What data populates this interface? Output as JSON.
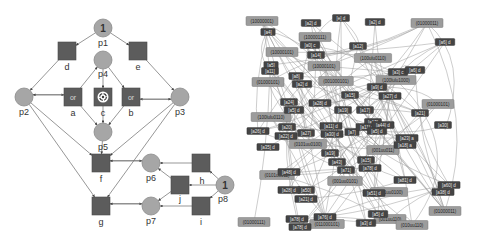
{
  "colors": {
    "place": "#a6a6a6",
    "transition": "#5c5c5c",
    "edge": "#6a6a6a",
    "state_node": "#9c9c9c",
    "action_node": "#444444",
    "background": "#ffffff"
  },
  "petri_net": {
    "places": [
      {
        "id": "p1",
        "label": "p1",
        "x": 103,
        "y": 28,
        "tokens": "1"
      },
      {
        "id": "p2",
        "label": "p2",
        "x": 24,
        "y": 97,
        "tokens": ""
      },
      {
        "id": "p3",
        "label": "p3",
        "x": 180,
        "y": 97,
        "tokens": ""
      },
      {
        "id": "p4",
        "label": "p4",
        "x": 103,
        "y": 60,
        "tokens": ""
      },
      {
        "id": "p5",
        "label": "p5",
        "x": 103,
        "y": 132,
        "tokens": ""
      },
      {
        "id": "p6",
        "label": "p6",
        "x": 151,
        "y": 163,
        "tokens": ""
      },
      {
        "id": "p7",
        "label": "p7",
        "x": 151,
        "y": 206,
        "tokens": ""
      },
      {
        "id": "p8",
        "label": "p8",
        "x": 225,
        "y": 185,
        "tokens": "1"
      }
    ],
    "transitions": [
      {
        "id": "d",
        "label": "d",
        "x": 67,
        "y": 51,
        "kind": "plain"
      },
      {
        "id": "e",
        "label": "e",
        "x": 138,
        "y": 51,
        "kind": "plain"
      },
      {
        "id": "a",
        "label": "a",
        "x": 73,
        "y": 97,
        "kind": "or",
        "glyph": "or"
      },
      {
        "id": "b",
        "label": "b",
        "x": 131,
        "y": 97,
        "kind": "or",
        "glyph": "or"
      },
      {
        "id": "c",
        "label": "c",
        "x": 103,
        "y": 97,
        "kind": "cycle"
      },
      {
        "id": "f",
        "label": "f",
        "x": 101,
        "y": 163,
        "kind": "plain"
      },
      {
        "id": "g",
        "label": "g",
        "x": 101,
        "y": 206,
        "kind": "plain"
      },
      {
        "id": "h",
        "label": "h",
        "x": 201,
        "y": 163,
        "kind": "plain"
      },
      {
        "id": "j",
        "label": "j",
        "x": 180,
        "y": 185,
        "kind": "plain"
      },
      {
        "id": "i",
        "label": "i",
        "x": 201,
        "y": 206,
        "kind": "plain"
      }
    ],
    "arcs": [
      [
        "p1",
        "d"
      ],
      [
        "p1",
        "e"
      ],
      [
        "d",
        "p2"
      ],
      [
        "e",
        "p3"
      ],
      [
        "p2",
        "a"
      ],
      [
        "a",
        "p2"
      ],
      [
        "p3",
        "b"
      ],
      [
        "b",
        "p3"
      ],
      [
        "a",
        "p4"
      ],
      [
        "p4",
        "b"
      ],
      [
        "c",
        "p5"
      ],
      [
        "a",
        "p5"
      ],
      [
        "b",
        "p5"
      ],
      [
        "p4",
        "c"
      ],
      [
        "p2",
        "f"
      ],
      [
        "p3",
        "f"
      ],
      [
        "p2",
        "g"
      ],
      [
        "p3",
        "g"
      ],
      [
        "p5",
        "f"
      ],
      [
        "f",
        "p6"
      ],
      [
        "p6",
        "f"
      ],
      [
        "g",
        "p7"
      ],
      [
        "p7",
        "g"
      ],
      [
        "h",
        "p6"
      ],
      [
        "j",
        "p6"
      ],
      [
        "j",
        "p7"
      ],
      [
        "i",
        "p7"
      ],
      [
        "p8",
        "h"
      ],
      [
        "p8",
        "j"
      ],
      [
        "p8",
        "i"
      ]
    ]
  },
  "state_graph": {
    "states": [
      {
        "label": "(10000001)",
        "x": 262,
        "y": 21
      },
      {
        "label": "(10000111)",
        "x": 315,
        "y": 37
      },
      {
        "label": "(10000101)",
        "x": 282,
        "y": 52
      },
      {
        "label": "(01000011)",
        "x": 427,
        "y": 23
      },
      {
        "label": "(100ulu0110)",
        "x": 373,
        "y": 58
      },
      {
        "label": "(10000101)",
        "x": 324,
        "y": 66
      },
      {
        "label": "(01000101)",
        "x": 268,
        "y": 82
      },
      {
        "label": "(001000101)",
        "x": 336,
        "y": 81
      },
      {
        "label": "(100lulu1000)",
        "x": 396,
        "y": 80
      },
      {
        "label": "(01000101)",
        "x": 438,
        "y": 104
      },
      {
        "label": "(100lulu0110)",
        "x": 271,
        "y": 117
      },
      {
        "label": "(0101uu0100)",
        "x": 308,
        "y": 144
      },
      {
        "label": "(001uu011)",
        "x": 383,
        "y": 150
      },
      {
        "label": "(0101uu011)",
        "x": 277,
        "y": 175
      },
      {
        "label": "(001uu0101)",
        "x": 345,
        "y": 181
      },
      {
        "label": "(1011uu0100)",
        "x": 389,
        "y": 192
      },
      {
        "label": "(01000111)",
        "x": 254,
        "y": 222
      },
      {
        "label": "(011000101)",
        "x": 327,
        "y": 224
      },
      {
        "label": "(001uu110)",
        "x": 390,
        "y": 219
      },
      {
        "label": "(01000011)",
        "x": 445,
        "y": 211
      },
      {
        "label": "(010uu110)",
        "x": 412,
        "y": 225
      }
    ],
    "actions": [
      {
        "label": "[a4]",
        "x": 268,
        "y": 32
      },
      {
        "label": "[a2] d",
        "x": 311,
        "y": 23
      },
      {
        "label": "[e] d",
        "x": 341,
        "y": 18
      },
      {
        "label": "[a2] d",
        "x": 375,
        "y": 22
      },
      {
        "label": "[a6] d",
        "x": 445,
        "y": 42
      },
      {
        "label": "[a0] c",
        "x": 310,
        "y": 45
      },
      {
        "label": "[a14]",
        "x": 316,
        "y": 55
      },
      {
        "label": "[a5]",
        "x": 271,
        "y": 65
      },
      {
        "label": "[a12]",
        "x": 358,
        "y": 46
      },
      {
        "label": "[a11]",
        "x": 270,
        "y": 71
      },
      {
        "label": "[a8]",
        "x": 296,
        "y": 76
      },
      {
        "label": "[a2] d",
        "x": 302,
        "y": 84
      },
      {
        "label": "[a3] c",
        "x": 398,
        "y": 72
      },
      {
        "label": "[a9] d",
        "x": 377,
        "y": 87
      },
      {
        "label": "[a27] d",
        "x": 390,
        "y": 96
      },
      {
        "label": "[a6] d",
        "x": 415,
        "y": 70
      },
      {
        "label": "[a15]",
        "x": 350,
        "y": 95
      },
      {
        "label": "[a28] d",
        "x": 320,
        "y": 103
      },
      {
        "label": "[a5] d",
        "x": 294,
        "y": 110
      },
      {
        "label": "[a24]",
        "x": 289,
        "y": 102
      },
      {
        "label": "[a19]",
        "x": 343,
        "y": 110
      },
      {
        "label": "[a17]",
        "x": 365,
        "y": 110
      },
      {
        "label": "[a21]",
        "x": 420,
        "y": 113
      },
      {
        "label": "[a30]",
        "x": 443,
        "y": 125
      },
      {
        "label": "[a26] d",
        "x": 258,
        "y": 131
      },
      {
        "label": "[a20]",
        "x": 287,
        "y": 127
      },
      {
        "label": "[a22] d",
        "x": 286,
        "y": 136
      },
      {
        "label": "[a27]",
        "x": 306,
        "y": 133
      },
      {
        "label": "[a11] d",
        "x": 331,
        "y": 126
      },
      {
        "label": "[a30] d",
        "x": 332,
        "y": 134
      },
      {
        "label": "[a7]",
        "x": 352,
        "y": 132
      },
      {
        "label": "[a13]",
        "x": 373,
        "y": 122
      },
      {
        "label": "[a11] d",
        "x": 367,
        "y": 127
      },
      {
        "label": "[a44] d",
        "x": 383,
        "y": 125
      },
      {
        "label": "[a23] a",
        "x": 407,
        "y": 138
      },
      {
        "label": "[a18] a",
        "x": 405,
        "y": 145
      },
      {
        "label": "[a5] d",
        "x": 377,
        "y": 131
      },
      {
        "label": "[a35] d",
        "x": 268,
        "y": 147
      },
      {
        "label": "[a19]",
        "x": 330,
        "y": 153
      },
      {
        "label": "[a43]",
        "x": 337,
        "y": 162
      },
      {
        "label": "[a71]",
        "x": 346,
        "y": 170
      },
      {
        "label": "[a15]",
        "x": 366,
        "y": 160
      },
      {
        "label": "[a78] d",
        "x": 370,
        "y": 168
      },
      {
        "label": "[a48] d",
        "x": 289,
        "y": 172
      },
      {
        "label": "[a50]",
        "x": 306,
        "y": 190
      },
      {
        "label": "[a81] d",
        "x": 405,
        "y": 180
      },
      {
        "label": "[a51] d",
        "x": 374,
        "y": 193
      },
      {
        "label": "[a60] d",
        "x": 449,
        "y": 185
      },
      {
        "label": "[a38] d",
        "x": 443,
        "y": 192
      },
      {
        "label": "[a28] d",
        "x": 289,
        "y": 190
      },
      {
        "label": "[a21] d",
        "x": 306,
        "y": 199
      },
      {
        "label": "[a78] d",
        "x": 297,
        "y": 219
      },
      {
        "label": "[a76] d",
        "x": 325,
        "y": 217
      },
      {
        "label": "[a78] d",
        "x": 300,
        "y": 227
      },
      {
        "label": "[a5] d",
        "x": 378,
        "y": 214
      },
      {
        "label": "[a3] d",
        "x": 366,
        "y": 223
      }
    ]
  }
}
